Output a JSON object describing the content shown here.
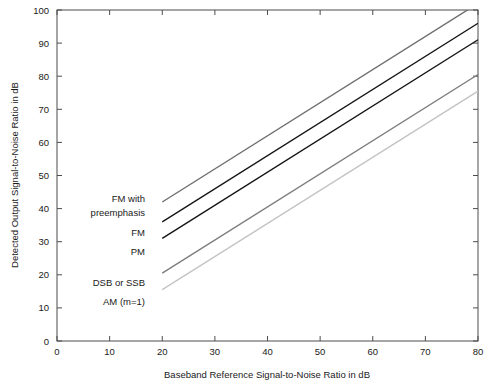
{
  "chart_data": {
    "type": "line",
    "title": "",
    "xlabel": "Baseband Reference Signal-to-Noise Ratio in dB",
    "ylabel": "Detected Output Signal-to-Noise Ratio in dB",
    "xlim": [
      0,
      80
    ],
    "ylim": [
      0,
      100
    ],
    "xticks": [
      0,
      10,
      20,
      30,
      40,
      50,
      60,
      70,
      80
    ],
    "yticks": [
      0,
      10,
      20,
      30,
      40,
      50,
      60,
      70,
      80,
      90,
      100
    ],
    "xtick_labels": [
      "0",
      "10",
      "20",
      "30",
      "40",
      "50",
      "60",
      "70",
      "80"
    ],
    "ytick_labels": [
      "0",
      "10",
      "20",
      "30",
      "40",
      "50",
      "60",
      "70",
      "80",
      "90",
      "100"
    ],
    "grid": false,
    "legend_position": "inline-annotations",
    "series": [
      {
        "name": "FM with preemphasis",
        "color": "#6e6e6e",
        "x": [
          20,
          80
        ],
        "y": [
          42,
          102
        ],
        "clip_at_ylim": true
      },
      {
        "name": "FM",
        "color": "#141414",
        "x": [
          20,
          80
        ],
        "y": [
          36,
          96
        ]
      },
      {
        "name": "PM",
        "color": "#141414",
        "x": [
          20,
          80
        ],
        "y": [
          31,
          91
        ]
      },
      {
        "name": "DSB or SSB",
        "color": "#7d7d7d",
        "x": [
          20,
          80
        ],
        "y": [
          20.5,
          80.5
        ]
      },
      {
        "name": "AM (m=1)",
        "color": "#c4c4c4",
        "x": [
          20,
          80
        ],
        "y": [
          15.5,
          75.5
        ]
      }
    ],
    "annotations": [
      {
        "text": "FM with",
        "x_px": 145,
        "y_px": 202
      },
      {
        "text": "preemphasis",
        "x_px": 145,
        "y_px": 216
      },
      {
        "text": "FM",
        "x_px": 145,
        "y_px": 236
      },
      {
        "text": "PM",
        "x_px": 145,
        "y_px": 255
      },
      {
        "text": "DSB or SSB",
        "x_px": 145,
        "y_px": 286
      },
      {
        "text": "AM (m=1)",
        "x_px": 145,
        "y_px": 305
      }
    ]
  },
  "axes": {
    "x_title": "Baseband Reference Signal-to-Noise Ratio in dB",
    "y_title": "Detected Output Signal-to-Noise Ratio in dB"
  },
  "ticks": {
    "x": [
      "0",
      "10",
      "20",
      "30",
      "40",
      "50",
      "60",
      "70",
      "80"
    ],
    "y": [
      "0",
      "10",
      "20",
      "30",
      "40",
      "50",
      "60",
      "70",
      "80",
      "90",
      "100"
    ]
  },
  "labels": {
    "fm_preemphasis_line1": "FM with",
    "fm_preemphasis_line2": "preemphasis",
    "fm": "FM",
    "pm": "PM",
    "dsb_ssb": "DSB or SSB",
    "am": "AM (m=1)"
  },
  "colors": {
    "axis": "#4d4d4d",
    "text": "#1a1a1a",
    "series_fm_preemphasis": "#6e6e6e",
    "series_fm": "#141414",
    "series_pm": "#141414",
    "series_dsb_ssb": "#7d7d7d",
    "series_am": "#c4c4c4",
    "background": "#ffffff"
  }
}
